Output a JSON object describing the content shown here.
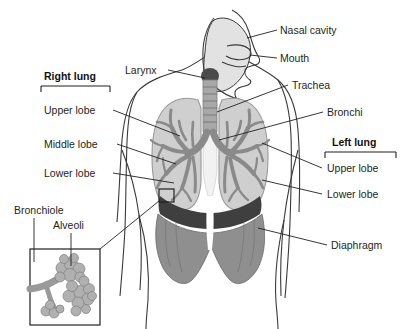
{
  "figure": {
    "background": "#ffffff"
  },
  "labels": {
    "nasal_cavity": "Nasal cavity",
    "mouth": "Mouth",
    "trachea": "Trachea",
    "bronchi": "Bronchi",
    "larynx": "Larynx",
    "diaphragm": "Diaphragm",
    "bronchiole": "Bronchiole",
    "alveoli": "Alveoli"
  },
  "right_lung": {
    "heading": "Right lung",
    "lobes": [
      "Upper lobe",
      "Middle lobe",
      "Lower lobe"
    ]
  },
  "left_lung": {
    "heading": "Left lung",
    "lobes": [
      "Upper lobe",
      "Lower lobe"
    ]
  },
  "colors": {
    "outline": "#3a3a3a",
    "text": "#231f20",
    "lung_fill": "#cfcfcf",
    "lung_edge": "#9a9a9a",
    "bronchial_tree": "#8a8a8a",
    "trachea_fill": "#a8a8a8",
    "larynx_dark": "#4a4a4a",
    "diaphragm": "#8f8f8f",
    "diaphragm_dark": "#3f3f3f",
    "head_cavity": "#e2e2e2",
    "alveoli_fill": "#b0b0b0",
    "airway_light": "#f2f2f2"
  }
}
